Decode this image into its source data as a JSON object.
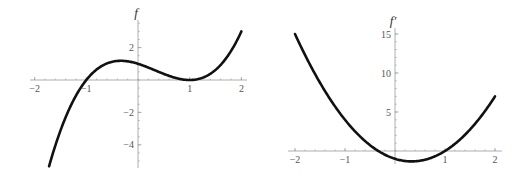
{
  "chart_data": [
    {
      "type": "line",
      "title": "",
      "ylabel": "f",
      "xlabel": "",
      "function": "(x-1)^2*(x+1)",
      "xlim": [
        -2,
        2
      ],
      "ylim": [
        -5.2,
        3.2
      ],
      "grid": false,
      "x_ticks": [
        -2,
        -1,
        1,
        2
      ],
      "x_tick_labels": [
        "−2",
        "−1",
        "1",
        "2"
      ],
      "y_ticks": [
        2,
        -2,
        -4
      ],
      "y_tick_labels": [
        "2",
        "−2",
        "−4"
      ],
      "series": [
        {
          "name": "f",
          "x": [
            -1.7,
            -1.5,
            -1.25,
            -1,
            -0.75,
            -0.5,
            -0.333,
            0,
            0.25,
            0.5,
            0.75,
            1,
            1.25,
            1.5,
            1.75,
            2
          ],
          "y": [
            -5.1,
            -3.13,
            -1.27,
            0,
            0.77,
            1.13,
            1.19,
            1,
            0.7,
            0.38,
            0.11,
            0,
            0.14,
            0.63,
            1.55,
            3
          ]
        }
      ]
    },
    {
      "type": "line",
      "title": "",
      "ylabel": "f′",
      "xlabel": "",
      "function": "3x^2-2x-1",
      "xlim": [
        -2,
        2
      ],
      "ylim": [
        -1.4,
        15
      ],
      "grid": false,
      "x_ticks": [
        -2,
        -1,
        1,
        2
      ],
      "x_tick_labels": [
        "−2",
        "−1",
        "1",
        "2"
      ],
      "y_ticks": [
        5,
        10,
        15
      ],
      "y_tick_labels": [
        "5",
        "10",
        "15"
      ],
      "series": [
        {
          "name": "f′",
          "x": [
            -2,
            -1.5,
            -1,
            -0.5,
            -0.333,
            0,
            0.333,
            0.5,
            1,
            1.5,
            2
          ],
          "y": [
            15,
            8.75,
            4,
            0.75,
            0,
            -1,
            -1.33,
            -1.25,
            0,
            2.75,
            7
          ]
        }
      ]
    }
  ]
}
